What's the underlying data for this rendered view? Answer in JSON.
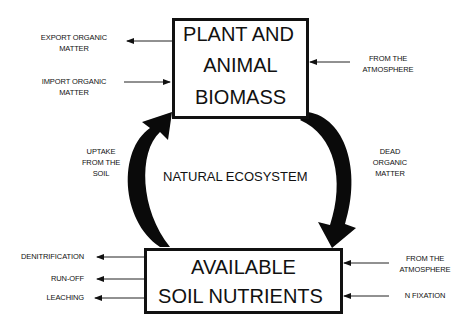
{
  "diagram": {
    "title_center": "NATURAL ECOSYSTEM",
    "nodes": {
      "biomass": {
        "lines": [
          "PLANT AND",
          "ANIMAL",
          "BIOMASS"
        ]
      },
      "soil": {
        "lines": [
          "AVAILABLE",
          "SOIL NUTRIENTS"
        ]
      }
    },
    "cycle_arrows": {
      "uptake": {
        "lines": [
          "UPTAKE",
          "FROM THE",
          "SOIL"
        ],
        "from": "soil",
        "to": "biomass"
      },
      "dead_matter": {
        "lines": [
          "DEAD",
          "ORGANIC",
          "MATTER"
        ],
        "from": "biomass",
        "to": "soil"
      }
    },
    "biomass_flows": {
      "export": {
        "lines": [
          "EXPORT ORGANIC",
          "MATTER"
        ],
        "direction": "out"
      },
      "import": {
        "lines": [
          "IMPORT ORGANIC",
          "MATTER"
        ],
        "direction": "in"
      },
      "atmosphere": {
        "lines": [
          "FROM THE",
          "ATMOSPHERE"
        ],
        "direction": "in"
      }
    },
    "soil_flows": {
      "denitrification": {
        "label": "DENITRIFICATION",
        "direction": "out"
      },
      "runoff": {
        "label": "RUN-OFF",
        "direction": "out"
      },
      "leaching": {
        "label": "LEACHING",
        "direction": "out"
      },
      "atmosphere": {
        "lines": [
          "FROM THE",
          "ATMOSPHERE"
        ],
        "direction": "in"
      },
      "n_fixation": {
        "label": "N FIXATION",
        "direction": "in"
      }
    }
  }
}
